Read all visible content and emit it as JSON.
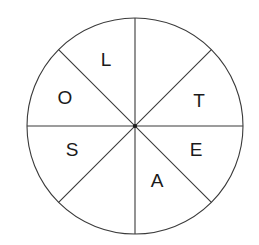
{
  "figure": {
    "type": "sector-wheel",
    "background_color": "#ffffff",
    "stroke_color": "#3a3a3a",
    "text_color": "#1a1a1a",
    "circle": {
      "center_x": 135,
      "center_y": 126,
      "radius": 108,
      "sector_count": 8
    },
    "sectors": [
      {
        "id": "sector-1",
        "label": "L",
        "angle_deg": 292.5,
        "label_x": 106,
        "label_y": 61
      },
      {
        "id": "sector-2",
        "label": "",
        "angle_deg": 337.5,
        "label_x": 170,
        "label_y": 61
      },
      {
        "id": "sector-3",
        "label": "T",
        "angle_deg": 22.5,
        "label_x": 199,
        "label_y": 102
      },
      {
        "id": "sector-4",
        "label": "E",
        "angle_deg": 67.5,
        "label_x": 196,
        "label_y": 151
      },
      {
        "id": "sector-5",
        "label": "A",
        "angle_deg": 112.5,
        "label_x": 157,
        "label_y": 182
      },
      {
        "id": "sector-6",
        "label": "",
        "angle_deg": 157.5,
        "label_x": 100,
        "label_y": 190
      },
      {
        "id": "sector-7",
        "label": "S",
        "angle_deg": 202.5,
        "label_x": 72,
        "label_y": 151
      },
      {
        "id": "sector-8",
        "label": "O",
        "angle_deg": 247.5,
        "label_x": 65,
        "label_y": 99
      }
    ],
    "letters_visible": [
      "L",
      "T",
      "E",
      "A",
      "S",
      "O"
    ],
    "dividers": [
      {
        "id": "divider-vertical",
        "x1": 135,
        "y1": 18,
        "x2": 135,
        "y2": 234
      },
      {
        "id": "divider-horizontal",
        "x1": 27,
        "y1": 126,
        "x2": 243,
        "y2": 126
      },
      {
        "id": "divider-diagonal-nwse",
        "x1": 59,
        "y1": 50,
        "x2": 211,
        "y2": 202
      },
      {
        "id": "divider-diagonal-nesw",
        "x1": 211,
        "y1": 50,
        "x2": 59,
        "y2": 202
      }
    ]
  }
}
